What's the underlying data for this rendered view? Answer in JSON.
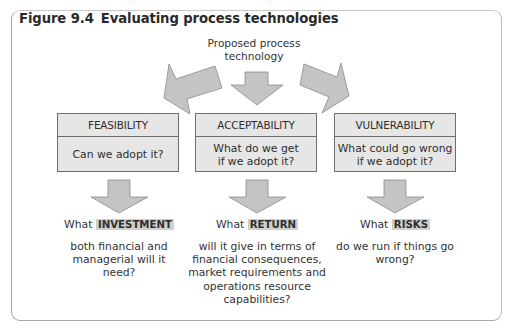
{
  "figure": {
    "number": "Figure 9.4",
    "title": "Evaluating process technologies"
  },
  "source": {
    "line1": "Proposed process",
    "line2": "technology"
  },
  "colors": {
    "arrow_fill": "#c4c4c4",
    "arrow_stroke": "#8a8a8a",
    "box_fill": "#e6e6e6",
    "highlight": "#cfcfcf",
    "frame": "#a6a6a6"
  },
  "boxes": [
    {
      "heading": "FEASIBILITY",
      "question_line1": "Can we adopt it?",
      "question_line2": ""
    },
    {
      "heading": "ACCEPTABILITY",
      "question_line1": "What do we get",
      "question_line2": "if we adopt it?"
    },
    {
      "heading": "VULNERABILITY",
      "question_line1": "What could go wrong",
      "question_line2": "if we adopt it?"
    }
  ],
  "results": [
    {
      "prefix": "What",
      "keyword": "INVESTMENT",
      "lines": [
        "both financial and",
        "managerial will it",
        "need?"
      ]
    },
    {
      "prefix": "What",
      "keyword": "RETURN",
      "lines": [
        "will it give in terms of",
        "financial consequences,",
        "market requirements and",
        "operations resource",
        "capabilities?"
      ]
    },
    {
      "prefix": "What",
      "keyword": "RISKS",
      "lines": [
        "do we run if things go",
        "wrong?"
      ]
    }
  ]
}
